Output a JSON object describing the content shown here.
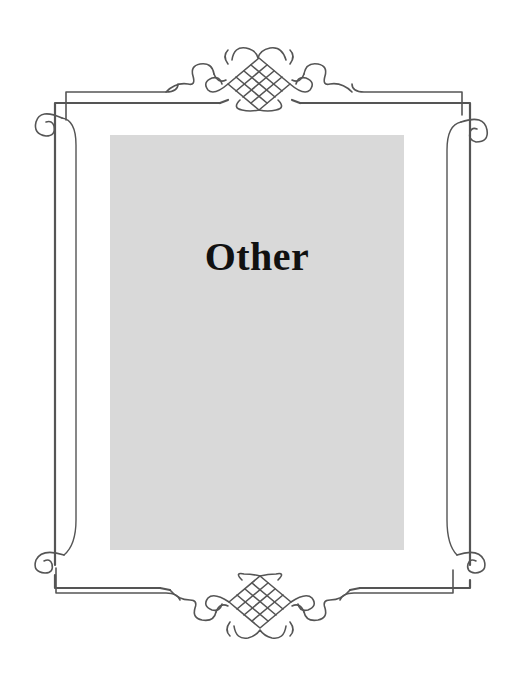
{
  "card": {
    "title": "Other"
  },
  "colors": {
    "background": "#ffffff",
    "panel": "#d9d9d9",
    "frame_line": "#555555",
    "title_text": "#111111"
  },
  "decorations": {
    "top_ornament": "filigree-lattice-icon",
    "bottom_ornament": "filigree-lattice-icon",
    "corner_scrolls": "scroll-curl-icon"
  }
}
